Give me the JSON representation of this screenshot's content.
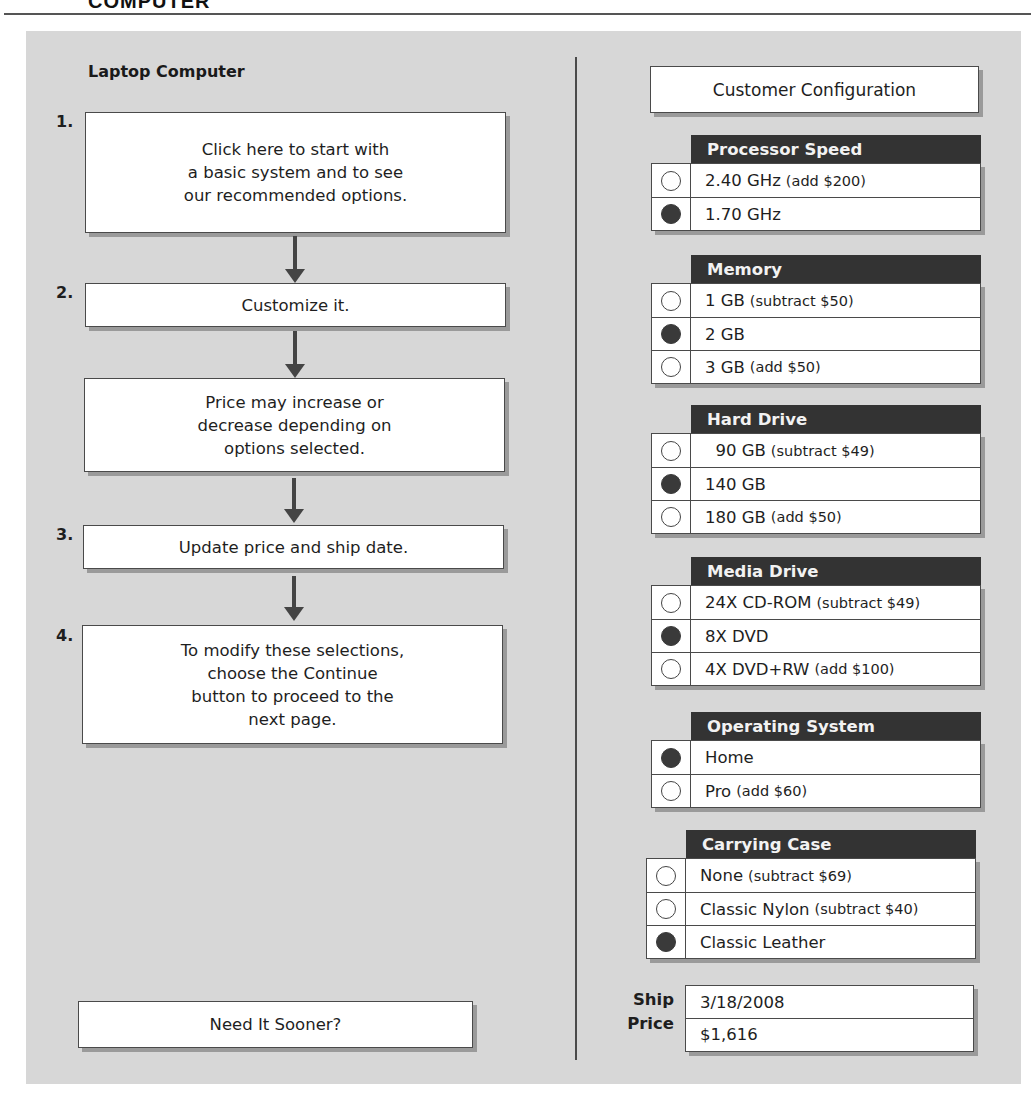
{
  "page": {
    "heading": "COMPUTER"
  },
  "left": {
    "title": "Laptop Computer",
    "steps": [
      {
        "number": "1.",
        "lines": [
          "Click here to start with",
          "a basic system and to see",
          "our recommended options."
        ]
      },
      {
        "number": "2.",
        "lines": [
          "Customize it."
        ]
      },
      {
        "number": "",
        "lines": [
          "Price may increase or",
          "decrease depending on",
          "options selected."
        ]
      },
      {
        "number": "3.",
        "lines": [
          "Update price and ship date."
        ]
      },
      {
        "number": "4.",
        "lines": [
          "To modify these selections,",
          "choose the Continue",
          "button to proceed to the",
          "next page."
        ]
      }
    ],
    "need_sooner_button": "Need It Sooner?"
  },
  "right": {
    "title": "Customer Configuration",
    "groups": [
      {
        "header": "Processor Speed",
        "options": [
          {
            "label": "2.40 GHz",
            "note": "(add $200)",
            "selected": false
          },
          {
            "label": "1.70 GHz",
            "note": "",
            "selected": true
          }
        ]
      },
      {
        "header": "Memory",
        "options": [
          {
            "label": "1 GB",
            "note": "(subtract $50)",
            "selected": false
          },
          {
            "label": "2 GB",
            "note": "",
            "selected": true
          },
          {
            "label": "3 GB",
            "note": "(add $50)",
            "selected": false
          }
        ]
      },
      {
        "header": "Hard Drive",
        "options": [
          {
            "label": "  90 GB",
            "note": "(subtract $49)",
            "selected": false
          },
          {
            "label": "140 GB",
            "note": "",
            "selected": true
          },
          {
            "label": "180 GB",
            "note": "(add $50)",
            "selected": false
          }
        ]
      },
      {
        "header": "Media Drive",
        "options": [
          {
            "label": "24X CD-ROM",
            "note": "(subtract $49)",
            "selected": false
          },
          {
            "label": "8X DVD",
            "note": "",
            "selected": true
          },
          {
            "label": "4X DVD+RW",
            "note": "(add $100)",
            "selected": false
          }
        ]
      },
      {
        "header": "Operating System",
        "options": [
          {
            "label": "Home",
            "note": "",
            "selected": true
          },
          {
            "label": "Pro",
            "note": "(add $60)",
            "selected": false
          }
        ]
      },
      {
        "header": "Carrying Case",
        "options": [
          {
            "label": "None",
            "note": "(subtract $69)",
            "selected": false
          },
          {
            "label": "Classic Nylon",
            "note": "(subtract $40)",
            "selected": false
          },
          {
            "label": "Classic Leather",
            "note": "",
            "selected": true
          }
        ]
      }
    ],
    "summary": {
      "ship_label": "Ship",
      "price_label": "Price",
      "ship_date": "3/18/2008",
      "price": "$1,616"
    }
  },
  "colors": {
    "panel_bg": "#d7d7d7",
    "header_bg": "#333333",
    "border": "#4a4a4a",
    "shadow": "#9a9a9a"
  }
}
